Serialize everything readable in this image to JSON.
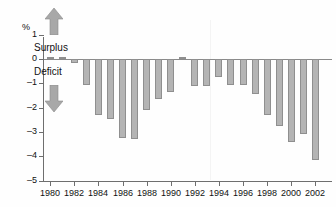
{
  "chart_data": {
    "type": "bar",
    "title": "",
    "subtitle": "",
    "xlabel": "",
    "ylabel": "%",
    "unit_label": "%",
    "ylim": [
      -5,
      1
    ],
    "yticks": [
      1,
      0,
      -1,
      -2,
      -3,
      -4,
      -5
    ],
    "ytick_labels": [
      "1",
      "0",
      "-1",
      "-2",
      "-3",
      "-4",
      "-5"
    ],
    "xlim": [
      1979.4,
      2002.6
    ],
    "xticks": [
      1980,
      1982,
      1984,
      1986,
      1988,
      1990,
      1992,
      1994,
      1996,
      1998,
      2000,
      2002
    ],
    "xtick_labels": [
      "1980",
      "1982",
      "1984",
      "1986",
      "1988",
      "1990",
      "1992",
      "1994",
      "1996",
      "1998",
      "2000",
      "2002"
    ],
    "grid": false,
    "legend": false,
    "bar_color": "#b4b4b4",
    "bar_edge_color": "#8f8f8f",
    "axis_color": "#6e6e6e",
    "categories": [
      1980,
      1981,
      1982,
      1983,
      1984,
      1985,
      1986,
      1987,
      1988,
      1989,
      1990,
      1991,
      1992,
      1993,
      1994,
      1995,
      1996,
      1997,
      1998,
      1999,
      2000,
      2001,
      2002
    ],
    "values": [
      0.1,
      0.1,
      -0.15,
      -1.05,
      -2.3,
      -2.45,
      -3.25,
      -3.3,
      -2.1,
      -1.65,
      -1.35,
      0.1,
      -1.1,
      -1.1,
      -0.75,
      -1.05,
      -1.05,
      -1.45,
      -2.3,
      -2.75,
      -3.4,
      -3.1,
      -4.15
    ],
    "annotations": [
      {
        "name": "surplus",
        "text": "Surplus",
        "direction": "up"
      },
      {
        "name": "deficit",
        "text": "Deficit",
        "direction": "down"
      }
    ]
  },
  "labels": {
    "unit": "%",
    "surplus": "Surplus",
    "deficit": "Deficit"
  }
}
